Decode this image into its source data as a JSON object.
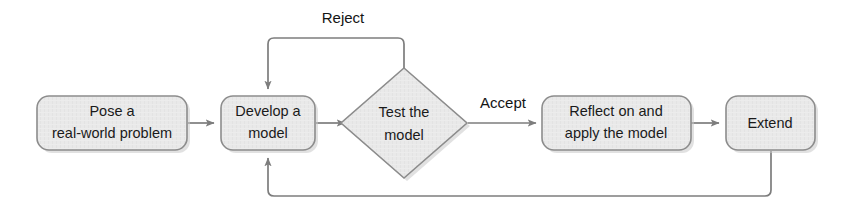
{
  "diagram": {
    "type": "flowchart",
    "background_color": "#ffffff",
    "node_fill_color": "#e9e9e9",
    "node_stroke_color": "#8c8c8c",
    "connector_color": "#7d7d7d",
    "text_color": "#1a1a1a",
    "nodes": [
      {
        "id": "pose",
        "shape": "rounded-rectangle",
        "lines": [
          "Pose a",
          "real-world problem"
        ]
      },
      {
        "id": "develop",
        "shape": "rounded-rectangle",
        "lines": [
          "Develop a",
          "model"
        ]
      },
      {
        "id": "test",
        "shape": "diamond",
        "lines": [
          "Test the",
          "model"
        ]
      },
      {
        "id": "reflect",
        "shape": "rounded-rectangle",
        "lines": [
          "Reflect on and",
          "apply the model"
        ]
      },
      {
        "id": "extend",
        "shape": "rounded-rectangle",
        "lines": [
          "Extend"
        ]
      }
    ],
    "edge_labels": [
      {
        "id": "reject",
        "text": "Reject"
      },
      {
        "id": "accept",
        "text": "Accept"
      }
    ],
    "edges": [
      {
        "from": "pose",
        "to": "develop",
        "label": ""
      },
      {
        "from": "develop",
        "to": "test",
        "label": ""
      },
      {
        "from": "test",
        "to": "develop",
        "label": "Reject"
      },
      {
        "from": "test",
        "to": "reflect",
        "label": "Accept"
      },
      {
        "from": "reflect",
        "to": "extend",
        "label": ""
      },
      {
        "from": "extend",
        "to": "develop",
        "label": ""
      }
    ]
  }
}
